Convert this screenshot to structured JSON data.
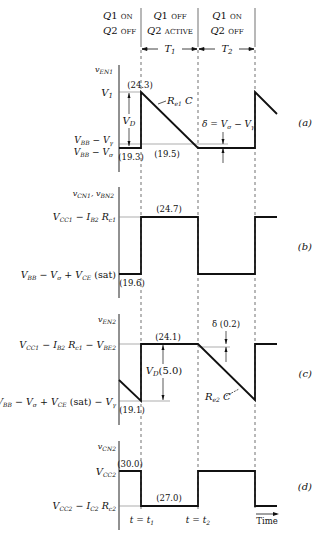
{
  "header": {
    "phases": [
      {
        "line1_q": "Q1",
        "line1_state": "ON",
        "line2_q": "Q2",
        "line2_state": "OFF"
      },
      {
        "line1_q": "Q1",
        "line1_state": "OFF",
        "line2_q": "Q2",
        "line2_state": "ACTIVE"
      },
      {
        "line1_q": "Q1",
        "line1_state": "ON",
        "line2_q": "Q2",
        "line2_state": "OFF"
      }
    ],
    "intervals": [
      "T1",
      "T2"
    ]
  },
  "panels": {
    "a": {
      "tag": "(a)",
      "ylabel": "vEN1",
      "levels": [
        "V1",
        "VBB − Vγ",
        "VBB − Vσ"
      ],
      "annotations": {
        "peak": "(24.3)",
        "low_left": "(19.3)",
        "low_mid": "(19.5)",
        "vd": "VD",
        "slope": "Re1 C",
        "delta": "δ = Vσ − Vγ"
      }
    },
    "b": {
      "tag": "(b)",
      "ylabel": "vCN1, vBN2",
      "levels": [
        "VCC1 − IB2 Rc1",
        "VBB − Vσ + VCE (sat)"
      ],
      "annotations": {
        "high": "(24.7)",
        "low": "(19.6)"
      }
    },
    "c": {
      "tag": "(c)",
      "ylabel": "vEN2",
      "levels": [
        "VCC1 − IB2 Rc1 − VBE2",
        "VBB − Vσ + VCE (sat) − Vγ"
      ],
      "annotations": {
        "high": "(24.1)",
        "low": "(19.1)",
        "vd": "VD (5.0)",
        "delta": "δ (0.2)",
        "slope": "Re2 C"
      }
    },
    "d": {
      "tag": "(d)",
      "ylabel": "vCN2",
      "levels": [
        "VCC2",
        "VCC2 − IC2 Rc2"
      ],
      "annotations": {
        "high": "(30.0)",
        "low": "(27.0)"
      },
      "xticks": [
        "t = t1",
        "t = t2"
      ],
      "xlabel": "Time"
    }
  }
}
